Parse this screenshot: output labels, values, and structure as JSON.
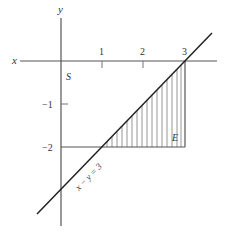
{
  "diagram": {
    "axes": {
      "x_label": "x",
      "y_label": "y",
      "x_ticks": [
        {
          "value": 1,
          "label": "1"
        },
        {
          "value": 2,
          "label": "2"
        },
        {
          "value": 3,
          "label": "3"
        }
      ],
      "y_ticks": [
        {
          "value": -1,
          "label": "−1"
        },
        {
          "value": -2,
          "label": "−2"
        }
      ]
    },
    "region_labels": {
      "S": "S",
      "E": "E"
    },
    "line": {
      "equation": "x − y = 3"
    },
    "shaded_region": {
      "description": "Triangle with vertices (1,−2), (3,−2), (3,0) hatched with vertical lines",
      "vertices": [
        [
          1,
          -2
        ],
        [
          3,
          -2
        ],
        [
          3,
          0
        ]
      ]
    },
    "colors": {
      "axis": "#555555",
      "line": "#222222",
      "hatch": "#888888",
      "text": "#333333"
    }
  }
}
